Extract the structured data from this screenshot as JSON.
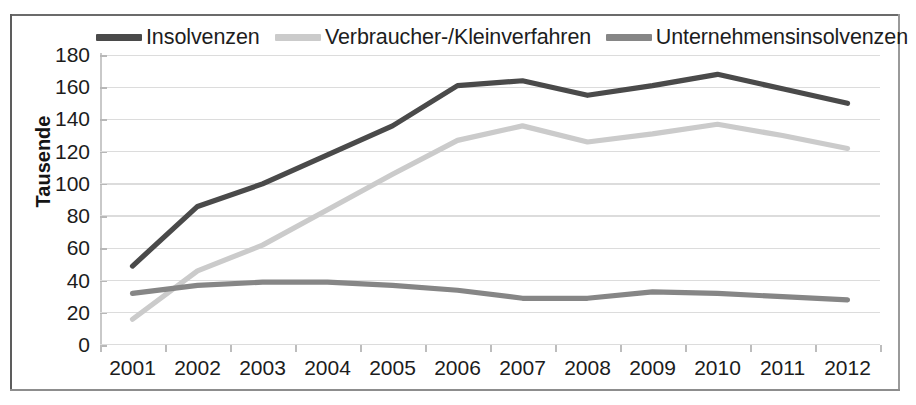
{
  "chart_data": {
    "type": "line",
    "title": "",
    "xlabel": "",
    "ylabel": "Tausende",
    "ylim": [
      0,
      180
    ],
    "ytick_step": 20,
    "grid": true,
    "legend_position": "top",
    "categories": [
      "2001",
      "2002",
      "2003",
      "2004",
      "2005",
      "2006",
      "2007",
      "2008",
      "2009",
      "2010",
      "2011",
      "2012"
    ],
    "yticks": [
      "0",
      "20",
      "40",
      "60",
      "80",
      "100",
      "120",
      "140",
      "160",
      "180"
    ],
    "series": [
      {
        "name": "Insolvenzen",
        "color": "#4a4a4a",
        "values": [
          49,
          86,
          100,
          118,
          136,
          161,
          164,
          155,
          161,
          168,
          159,
          150
        ]
      },
      {
        "name": "Verbraucher-/Kleinverfahren",
        "color": "#cbcbcb",
        "values": [
          16,
          46,
          62,
          84,
          106,
          127,
          136,
          126,
          131,
          137,
          130,
          122
        ]
      },
      {
        "name": "Unternehmensinsolvenzen",
        "color": "#868686",
        "values": [
          32,
          37,
          39,
          39,
          37,
          34,
          29,
          29,
          33,
          32,
          30,
          28
        ]
      }
    ]
  },
  "legend": {
    "entries": [
      {
        "label": "Insolvenzen",
        "color": "#4a4a4a"
      },
      {
        "label": "Verbraucher-/Kleinverfahren",
        "color": "#cbcbcb"
      },
      {
        "label": "Unternehmensinsolvenzen",
        "color": "#868686"
      }
    ]
  },
  "axes": {
    "y_title": "Tausende"
  }
}
